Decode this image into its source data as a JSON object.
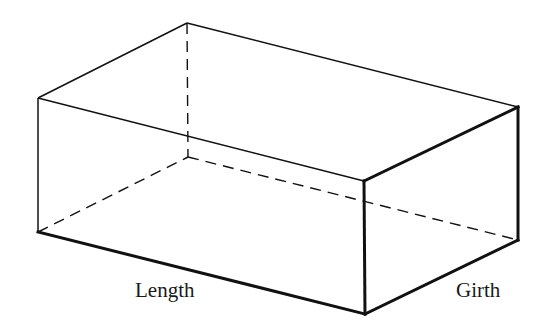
{
  "diagram": {
    "type": "rectangular-box-isometric",
    "labels": {
      "length": "Length",
      "girth": "Girth"
    },
    "colors": {
      "background": "#ffffff",
      "line": "#111111"
    },
    "vertices": {
      "front_top_left": [
        38,
        98
      ],
      "front_top_right": [
        364,
        181
      ],
      "front_bottom_left": [
        38,
        232
      ],
      "front_bottom_right": [
        365,
        314
      ],
      "back_top_left": [
        187,
        23
      ],
      "back_top_right": [
        518,
        107
      ],
      "back_bottom_left": [
        188,
        157
      ],
      "back_bottom_right": [
        518,
        240
      ]
    }
  }
}
